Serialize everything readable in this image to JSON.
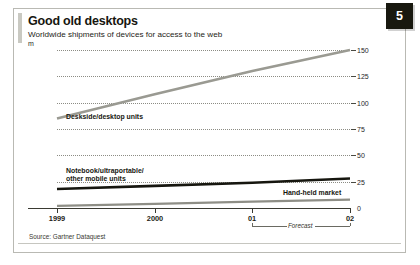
{
  "figure": {
    "badge_number": "5",
    "title": "Good old desktops",
    "subtitle": "Worldwide shipments of devices for access to the web",
    "unit": "m",
    "source": "Source: Gartner Dataquest"
  },
  "colors": {
    "desktop_line": "#9a9a92",
    "notebook_line": "#16160f",
    "handheld_line": "#8e8e86",
    "grid": "#8c8c84",
    "axis": "#3a3a32",
    "badge_bg": "#18180f",
    "frame": "#b9b9b3"
  },
  "annotations": {
    "forecast_label": "Forecast",
    "series_label_desktop": "Deskside/desktop units",
    "series_label_notebook_line1": "Notebook/ultraportable/",
    "series_label_notebook_line2": "other mobile units",
    "series_label_handheld": "Hand-held market"
  },
  "chart_data": {
    "type": "line",
    "title": "Good old desktops",
    "subtitle": "Worldwide shipments of devices for access to the web",
    "xlabel": "",
    "ylabel": "m",
    "ylim": [
      0,
      150
    ],
    "yticks": [
      0,
      25,
      50,
      75,
      100,
      125,
      150
    ],
    "ytick_labels": [
      "0",
      "25",
      "50",
      "75",
      "100",
      "125",
      "150"
    ],
    "x": [
      "1999",
      "2000",
      "01",
      "02"
    ],
    "xtick_labels": [
      "1999",
      "2000",
      "01",
      "02"
    ],
    "grid": "horizontal-dotted",
    "legend": "inline-annotations",
    "forecast_range": [
      "01",
      "02"
    ],
    "series": [
      {
        "name": "Deskside/desktop units",
        "color": "#9a9a92",
        "values": [
          85,
          108,
          130,
          150
        ]
      },
      {
        "name": "Notebook/ultraportable/other mobile units",
        "color": "#16160f",
        "values": [
          18,
          21,
          24,
          28
        ]
      },
      {
        "name": "Hand-held market",
        "color": "#8e8e86",
        "values": [
          2,
          4,
          6,
          8
        ]
      }
    ],
    "source": "Source: Gartner Dataquest"
  }
}
